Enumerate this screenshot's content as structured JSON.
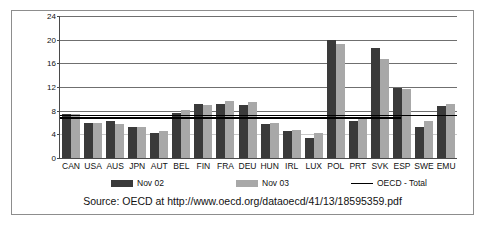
{
  "chart_data": {
    "type": "bar",
    "title": "",
    "xlabel": "",
    "ylabel": "",
    "ylim": [
      0,
      24
    ],
    "yticks": [
      0,
      4,
      8,
      12,
      16,
      20,
      24
    ],
    "grid": true,
    "legend_position": "bottom",
    "categories": [
      "CAN",
      "USA",
      "AUS",
      "JPN",
      "AUT",
      "BEL",
      "FIN",
      "FRA",
      "DEU",
      "HUN",
      "IRL",
      "LUX",
      "POL",
      "PRT",
      "SVK",
      "ESP",
      "SWE",
      "EMU"
    ],
    "series": [
      {
        "name": "Nov 02",
        "color": "#3a3a3a",
        "values": [
          7.5,
          5.9,
          6.2,
          5.3,
          4.2,
          7.6,
          9.1,
          9.1,
          9.0,
          5.8,
          4.6,
          3.3,
          19.9,
          6.2,
          18.6,
          11.9,
          5.3,
          8.8
        ]
      },
      {
        "name": "Nov 03",
        "color": "#a8a8a8",
        "values": [
          7.5,
          5.9,
          5.7,
          5.3,
          4.6,
          8.1,
          9.0,
          9.6,
          9.4,
          6.0,
          4.8,
          4.2,
          19.3,
          7.0,
          16.7,
          11.6,
          6.3,
          9.1
        ]
      }
    ],
    "reference_lines": [
      {
        "name": "OECD - Total",
        "label": "OECD - Total",
        "value": 7.3,
        "color": "#000000",
        "extent": 1.0
      },
      {
        "name": "OECD - Total",
        "label": "OECD - Total",
        "value": 6.9,
        "color": "#000000",
        "extent": 0.86
      }
    ],
    "annotations": []
  },
  "legend": {
    "items": [
      {
        "label": "Nov 02",
        "marker": "bar-swatch-dark"
      },
      {
        "label": "Nov 03",
        "marker": "bar-swatch-gray"
      },
      {
        "label": "OECD - Total",
        "marker": "line-swatch-black"
      }
    ]
  },
  "source": {
    "text": "Source: OECD at http://www.oecd.org/dataoecd/41/13/18595359.pdf"
  }
}
